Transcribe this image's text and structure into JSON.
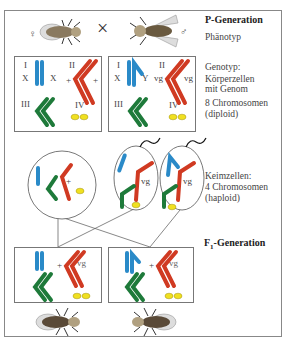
{
  "labels": {
    "p_generation": "P-Generation",
    "phenotype": "Phänotyp",
    "genotype": "Genotyp:",
    "body_cells_1": "Körperzellen",
    "body_cells_2": "mit Genom",
    "chromosomes_8": "8 Chromosomen",
    "diploid": "(diploid)",
    "germ_cells": "Keimzellen:",
    "chromosomes_4": "4 Chromosomen",
    "haploid": "(haploid)",
    "f1_prefix": "F",
    "f1_sub": "1",
    "f1_suffix": "-Generation"
  },
  "parents": {
    "female_symbol": "♀",
    "male_symbol": "♂",
    "cross_symbol": "×"
  },
  "female_cell": {
    "I": "I",
    "X1": "X",
    "X2": "X",
    "II": "II",
    "plus1": "+",
    "plus2": "+",
    "III": "III",
    "IV": "IV"
  },
  "male_cell": {
    "I": "I",
    "X": "X",
    "Y": "Y",
    "II": "II",
    "vg1": "vg",
    "vg2": "vg",
    "III": "III",
    "IV": "IV"
  },
  "gametes": {
    "egg_allele": "+",
    "sperm1_allele": "vg",
    "sperm2_allele": "vg"
  },
  "f1": {
    "left_plus": "+",
    "left_vg": "vg",
    "right_plus": "+",
    "right_vg": "vg"
  },
  "colors": {
    "chrom_I": "#2a8ac8",
    "chrom_II": "#d03a22",
    "chrom_III": "#1e7a3a",
    "chrom_IV": "#f0e020"
  }
}
